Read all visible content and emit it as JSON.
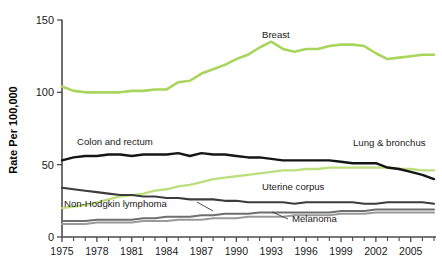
{
  "chart": {
    "type": "line",
    "title": "",
    "ylabel": "Rate Per 100,000",
    "xlabel": ""
  },
  "axes": {
    "y_ticks": [
      "0",
      "50",
      "100",
      "150"
    ],
    "x_ticks": [
      "1975",
      "1978",
      "1981",
      "1984",
      "1987",
      "1990",
      "1993",
      "1996",
      "1999",
      "2002",
      "2005"
    ]
  },
  "labels": {
    "breast": "Breast",
    "colon": "Colon and rectum",
    "lung": "Lung & bronchus",
    "uterine": "Uterine corpus",
    "nhl": "Non-Hodgkin lymphoma",
    "melanoma": "Melanoma"
  },
  "colors": {
    "breast": "#a8d65c",
    "lung": "#bcdf7d",
    "colon": "#151515",
    "uterine": "#3c3c3c",
    "nhl": "#6f6f6f",
    "melanoma": "#9a9a9a",
    "axis": "#4b4b4b",
    "text": "#1a1a1a",
    "background": "#ffffff"
  },
  "chart_data": {
    "type": "line",
    "title": "",
    "xlabel": "",
    "ylabel": "Rate Per 100,000",
    "xlim": [
      1975,
      2007
    ],
    "ylim": [
      0,
      150
    ],
    "grid": false,
    "legend": "inline-annotations",
    "x": [
      1975,
      1976,
      1977,
      1978,
      1979,
      1980,
      1981,
      1982,
      1983,
      1984,
      1985,
      1986,
      1987,
      1988,
      1989,
      1990,
      1991,
      1992,
      1993,
      1994,
      1995,
      1996,
      1997,
      1998,
      1999,
      2000,
      2001,
      2002,
      2003,
      2004,
      2005,
      2006,
      2007
    ],
    "series": [
      {
        "name": "Breast",
        "color": "#a8d65c",
        "values": [
          104,
          101,
          100,
          100,
          100,
          100,
          101,
          101,
          102,
          102,
          107,
          108,
          113,
          116,
          119,
          123,
          126,
          131,
          135,
          130,
          128,
          130,
          130,
          132,
          133,
          133,
          132,
          127,
          123,
          124,
          125,
          126,
          126
        ]
      },
      {
        "name": "Colon and rectum",
        "color": "#151515",
        "values": [
          53,
          55,
          56,
          56,
          57,
          57,
          56,
          57,
          57,
          57,
          58,
          56,
          58,
          57,
          57,
          56,
          55,
          55,
          54,
          53,
          53,
          53,
          53,
          53,
          52,
          51,
          51,
          51,
          48,
          47,
          45,
          43,
          40
        ]
      },
      {
        "name": "Lung & bronchus",
        "color": "#bcdf7d",
        "values": [
          20,
          21,
          22,
          24,
          26,
          28,
          29,
          30,
          32,
          33,
          35,
          36,
          38,
          40,
          41,
          42,
          43,
          44,
          45,
          46,
          46,
          47,
          47,
          48,
          48,
          48,
          48,
          48,
          48,
          47,
          47,
          46,
          46
        ]
      },
      {
        "name": "Uterine corpus",
        "color": "#3c3c3c",
        "values": [
          34,
          33,
          32,
          31,
          30,
          29,
          29,
          28,
          28,
          27,
          27,
          26,
          26,
          26,
          25,
          25,
          24,
          24,
          24,
          24,
          23,
          24,
          24,
          24,
          24,
          24,
          23,
          23,
          24,
          24,
          24,
          24,
          23
        ]
      },
      {
        "name": "Non-Hodgkin lymphoma",
        "color": "#6f6f6f",
        "values": [
          11,
          11,
          11,
          12,
          12,
          12,
          12,
          13,
          13,
          14,
          14,
          14,
          15,
          15,
          16,
          16,
          16,
          17,
          17,
          17,
          17,
          17,
          17,
          17,
          18,
          18,
          18,
          19,
          19,
          19,
          19,
          19,
          19
        ]
      },
      {
        "name": "Melanoma",
        "color": "#9a9a9a",
        "values": [
          9,
          9,
          9,
          10,
          10,
          10,
          10,
          11,
          11,
          11,
          12,
          12,
          12,
          13,
          13,
          13,
          14,
          14,
          14,
          14,
          15,
          15,
          15,
          15,
          16,
          16,
          16,
          17,
          17,
          17,
          17,
          17,
          17
        ]
      }
    ]
  }
}
